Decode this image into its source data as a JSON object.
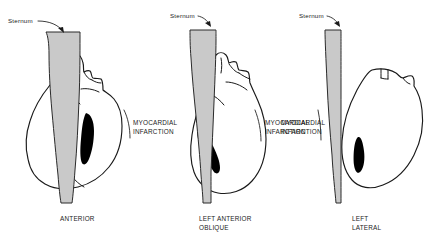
{
  "figure": {
    "background_color": "#ffffff",
    "ink_color": "#1a1a1a",
    "sternum_fill": "#c9c9c9",
    "heart_fill": "#ffffff",
    "infarct_fill": "#000000"
  },
  "panels": [
    {
      "id": "anterior",
      "view_label": "ANTERIOR",
      "sternum_label": "Sternum",
      "infarct_label_line1": "MYOCARDIAL",
      "infarct_label_line2": "INFARCTION"
    },
    {
      "id": "left-anterior-oblique",
      "view_label_line1": "LEFT ANTERIOR",
      "view_label_line2": "OBLIQUE",
      "sternum_label": "Sternum",
      "infarct_label_line1": "MYOCARDIAL",
      "infarct_label_line2": "INFARCTION"
    },
    {
      "id": "left-lateral",
      "view_label_line1": "LEFT",
      "view_label_line2": "LATERAL",
      "sternum_label": "Sternum",
      "infarct_label_line1": "MYOCARDIAL",
      "infarct_label_line2": "INFARCTION"
    }
  ]
}
